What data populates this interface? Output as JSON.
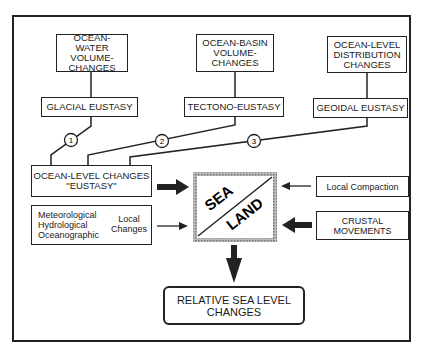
{
  "top_boxes": [
    {
      "label": "OCEAN-WATER\nVOLUME-\nCHANGES"
    },
    {
      "label": "OCEAN-BASIN\nVOLUME-\nCHANGES"
    },
    {
      "label": "OCEAN-LEVEL\nDISTRIBUTION\nCHANGES"
    }
  ],
  "eustasy_boxes": [
    {
      "label": "GLACIAL EUSTASY"
    },
    {
      "label": "TECTONO-EUSTASY"
    },
    {
      "label": "GEOIDAL EUSTASY"
    }
  ],
  "markers": [
    "1",
    "2",
    "3"
  ],
  "ocean_level": {
    "line1": "OCEAN-LEVEL CHANGES",
    "line2": "\"EUSTASY\""
  },
  "local_changes": {
    "items": [
      "Meteorological",
      "Hydrological",
      "Oceanographic"
    ],
    "group_label": "Local\nChanges"
  },
  "center": {
    "sea": "SEA",
    "land": "LAND"
  },
  "local_compaction": "Local Compaction",
  "crustal": "CRUSTAL\nMOVEMENTS",
  "result": "RELATIVE SEA LEVEL\nCHANGES"
}
